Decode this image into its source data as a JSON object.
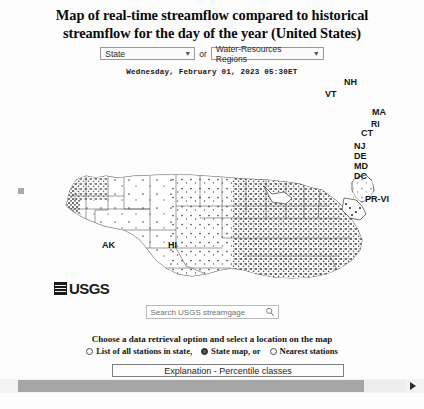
{
  "page": {
    "title_line1": "Map of real-time streamflow compared to historical",
    "title_line2": "streamflow for the day of the year (United States)",
    "timestamp": "Wednesday, February 01, 2023 05:30ET",
    "background_color": "#fdfdfd",
    "text_color": "#141414"
  },
  "selector": {
    "state_select_value": "State",
    "or_label": "or",
    "region_select_value": "Water-Resources Regions",
    "caret_icon": "chevron-down-icon"
  },
  "map": {
    "agency_logo_text": "USGS",
    "logo_mark_icon": "usgs-hatched-square-icon",
    "labels": [
      {
        "text": "NH",
        "x": 344,
        "y": 106
      },
      {
        "text": "VT",
        "x": 327,
        "y": 117
      },
      {
        "text": "MA",
        "x": 372,
        "y": 135
      },
      {
        "text": "RI",
        "x": 371,
        "y": 146
      },
      {
        "text": "CT",
        "x": 362,
        "y": 155
      },
      {
        "text": "NJ",
        "x": 355,
        "y": 168
      },
      {
        "text": "DE",
        "x": 355,
        "y": 178
      },
      {
        "text": "MD",
        "x": 355,
        "y": 188
      },
      {
        "text": "DC",
        "x": 355,
        "y": 198
      },
      {
        "text": "PR-VI",
        "x": 366,
        "y": 224
      },
      {
        "text": "AK",
        "x": 104,
        "y": 268
      },
      {
        "text": "HI",
        "x": 170,
        "y": 268
      }
    ]
  },
  "search": {
    "placeholder": "Search USGS streamgage",
    "icon": "magnifier-icon"
  },
  "retrieval": {
    "heading": "Choose a data retrieval option and select a location on the map",
    "options": [
      {
        "label": "List of all stations in state,",
        "selected": false
      },
      {
        "label": "State map, or",
        "selected": true
      },
      {
        "label": "Nearest stations",
        "selected": false
      }
    ]
  },
  "explanation": {
    "label": "Explanation - Percentile classes"
  },
  "scrollbar": {
    "orientation": "horizontal",
    "thumb_color": "#a6a6a6",
    "track_color": "#ededed",
    "arrow_icon": "chevron-right-icon"
  }
}
